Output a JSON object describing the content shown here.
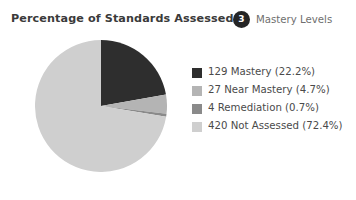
{
  "header": {
    "title": "Percentage of Standards Assessed",
    "badge_count": "3",
    "badge_label": "Mastery Levels",
    "badge_icon": "numbered-circle-badge-icon"
  },
  "colors": {
    "background": "#ffffff",
    "title_text": "#3a3a3a",
    "legend_text": "#4a4a4a",
    "badge_bg": "#252525",
    "badge_text": "#ffffff",
    "subtitle_text": "#6f6f6f"
  },
  "chart_data": {
    "type": "pie",
    "title": "Percentage of Standards Assessed",
    "xlabel": "",
    "ylabel": "",
    "legend_position": "right",
    "grid": false,
    "start_angle_deg": 0,
    "direction": "clockwise",
    "total_count": 580,
    "categories": [
      "Mastery",
      "Near Mastery",
      "Remediation",
      "Not Assessed"
    ],
    "counts": [
      129,
      27,
      4,
      420
    ],
    "values": [
      22.2,
      4.7,
      0.7,
      72.4
    ],
    "colors": [
      "#2e2e2e",
      "#b4b4b4",
      "#8a8a8a",
      "#cfcfcf"
    ],
    "labels": [
      "129 Mastery (22.2%)",
      "27 Near Mastery (4.7%)",
      "4 Remediation (0.7%)",
      "420 Not Assessed (72.4%)"
    ]
  },
  "legend": {
    "items": [
      {
        "label": "129 Mastery (22.2%)",
        "color": "#2e2e2e"
      },
      {
        "label": "27 Near Mastery (4.7%)",
        "color": "#b4b4b4"
      },
      {
        "label": "4 Remediation (0.7%)",
        "color": "#8a8a8a"
      },
      {
        "label": "420 Not Assessed (72.4%)",
        "color": "#cfcfcf"
      }
    ]
  }
}
